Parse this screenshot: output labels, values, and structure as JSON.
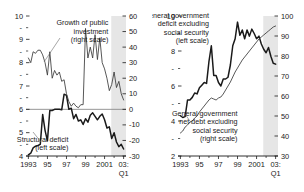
{
  "chart_data": [
    {
      "type": "line",
      "panel": "left",
      "title": "",
      "xlabel": "",
      "ylabel_left": "",
      "ylabel_right": "",
      "xlim": [
        1992.75,
        2003.25
      ],
      "x_tick_labels": [
        "1993",
        "95",
        "97",
        "99",
        "2001",
        "03:"
      ],
      "x_tick_values": [
        1993,
        1995,
        1997,
        1999,
        2001,
        2003
      ],
      "x_tick_sublabel": "Q1",
      "left_axis": {
        "ylim": [
          4,
          10
        ],
        "tick_labels": [
          "4",
          "5",
          "6",
          "7",
          "8",
          "9",
          "10"
        ],
        "tick_values": [
          4,
          5,
          6,
          7,
          8,
          9,
          10
        ],
        "minor_tick_values": [
          4.5,
          5.5,
          6.5,
          7.5,
          8.5,
          9.5
        ]
      },
      "right_axis": {
        "ylim": [
          -30,
          60
        ],
        "tick_labels": [
          "-30",
          "-20",
          "-10",
          "0",
          "10",
          "20",
          "30",
          "40",
          "50",
          "60"
        ],
        "tick_values": [
          -30,
          -20,
          -10,
          0,
          10,
          20,
          30,
          40,
          50,
          60
        ]
      },
      "shaded_band": {
        "x_start": 2001.7,
        "x_end": 2003.25,
        "color": "#e6e6e6"
      },
      "zero_reference": {
        "right_value": 0,
        "left_value": 6,
        "color": "#8a8a8a"
      },
      "annotations": [
        {
          "text_lines": [
            "Growth of public",
            "investment",
            "(right scale)"
          ],
          "x": 2001.4,
          "y": 54
        },
        {
          "text_lines": [
            "Structural deficit",
            "(left scale)"
          ],
          "x": 1997.2,
          "y": -21
        }
      ],
      "series": [
        {
          "name": "Structural deficit (left scale)",
          "axis": "left",
          "style": "thick",
          "x": [
            1993.0,
            1993.25,
            1993.5,
            1993.75,
            1994.0,
            1994.25,
            1994.5,
            1994.75,
            1995.0,
            1995.25,
            1995.5,
            1995.75,
            1996.0,
            1996.25,
            1996.5,
            1996.75,
            1997.0,
            1997.25,
            1997.5,
            1997.75,
            1998.0,
            1998.25,
            1998.5,
            1998.75,
            1999.0,
            1999.25,
            1999.5,
            1999.75,
            2000.0,
            2000.25,
            2000.5,
            2000.75,
            2001.0,
            2001.25,
            2001.5,
            2001.75,
            2002.0,
            2002.25,
            2002.5,
            2002.75,
            2003.0
          ],
          "values": [
            4.05,
            4.12,
            4.35,
            4.42,
            4.45,
            4.5,
            5.78,
            5.1,
            4.65,
            5.95,
            5.95,
            6.0,
            6.0,
            6.0,
            5.98,
            6.65,
            6.6,
            6.0,
            6.05,
            5.6,
            5.78,
            5.5,
            5.55,
            5.35,
            5.6,
            5.45,
            5.75,
            5.85,
            5.7,
            5.55,
            5.7,
            5.8,
            5.55,
            5.2,
            5.25,
            4.75,
            5.0,
            4.6,
            4.4,
            4.5,
            4.3
          ]
        },
        {
          "name": "Growth of public investment (right scale)",
          "axis": "right",
          "style": "thin",
          "x": [
            1993.0,
            1993.25,
            1993.5,
            1993.75,
            1994.0,
            1994.25,
            1994.5,
            1994.75,
            1995.0,
            1995.25,
            1995.5,
            1995.75,
            1996.0,
            1996.25,
            1996.5,
            1996.75,
            1997.0,
            1997.25,
            1997.5,
            1997.75,
            1998.0,
            1998.25,
            1998.5,
            1998.75,
            1999.0,
            1999.25,
            1999.5,
            1999.75,
            2000.0,
            2000.25,
            2000.5,
            2000.75,
            2001.0,
            2001.25,
            2001.5,
            2001.75,
            2002.0,
            2002.25,
            2002.5,
            2002.75,
            2003.0
          ],
          "values": [
            33,
            30,
            37,
            36,
            38,
            38,
            35,
            30,
            22,
            37,
            20,
            25,
            22,
            24,
            18,
            19,
            10,
            5,
            2,
            4,
            2,
            1,
            3,
            3,
            52,
            33,
            40,
            33,
            48,
            32,
            46,
            30,
            26,
            20,
            12,
            16,
            24,
            14,
            18,
            10,
            6
          ]
        }
      ]
    },
    {
      "type": "line",
      "panel": "right",
      "title": "",
      "xlabel": "",
      "xlim": [
        1992.75,
        2003.25
      ],
      "x_tick_labels": [
        "1993",
        "95",
        "97",
        "99",
        "2001",
        "03:"
      ],
      "x_tick_values": [
        1993,
        1995,
        1997,
        1999,
        2001,
        2003
      ],
      "x_tick_sublabel": "Q1",
      "left_axis": {
        "ylim": [
          2,
          10
        ],
        "tick_labels": [
          "2",
          "4",
          "6",
          "8",
          "10"
        ],
        "tick_values": [
          2,
          4,
          6,
          8,
          10
        ],
        "minor_tick_values": [
          3,
          5,
          7,
          9
        ]
      },
      "right_axis": {
        "ylim": [
          30,
          100
        ],
        "tick_labels": [
          "30",
          "40",
          "50",
          "60",
          "70",
          "80",
          "90",
          "100"
        ],
        "tick_values": [
          30,
          40,
          50,
          60,
          70,
          80,
          90,
          100
        ]
      },
      "shaded_band": {
        "x_start": 2001.7,
        "x_end": 2003.25,
        "color": "#e6e6e6"
      },
      "annotations": [
        {
          "text_lines": [
            "General government",
            "deficit excluding",
            "social security",
            "(left scale)"
          ],
          "x": 1996.0,
          "y": 9.9
        },
        {
          "text_lines": [
            "General government",
            "net debt excluding",
            "social security",
            "(right scale)"
          ],
          "x": 1999.0,
          "y": 4.3
        }
      ],
      "series": [
        {
          "name": "General government deficit excluding social security (left scale)",
          "axis": "left",
          "style": "thick",
          "x": [
            1993.0,
            1993.25,
            1993.5,
            1993.75,
            1994.0,
            1994.25,
            1994.5,
            1994.75,
            1995.0,
            1995.25,
            1995.5,
            1995.75,
            1996.0,
            1996.25,
            1996.5,
            1996.75,
            1997.0,
            1997.25,
            1997.5,
            1997.75,
            1998.0,
            1998.25,
            1998.5,
            1998.75,
            1999.0,
            1999.25,
            1999.5,
            1999.75,
            2000.0,
            2000.25,
            2000.5,
            2000.75,
            2001.0,
            2001.25,
            2001.5,
            2001.75,
            2002.0,
            2002.25,
            2002.5,
            2002.75,
            2003.0
          ],
          "values": [
            4.3,
            4.2,
            4.25,
            5.2,
            5.2,
            5.35,
            5.6,
            5.55,
            5.9,
            6.05,
            6.2,
            6.15,
            7.4,
            8.3,
            6.6,
            6.6,
            6.2,
            6.0,
            6.4,
            6.4,
            6.5,
            7.2,
            8.3,
            8.7,
            9.65,
            8.9,
            9.2,
            8.7,
            9.2,
            8.85,
            9.25,
            9.0,
            8.7,
            8.85,
            8.4,
            8.1,
            7.9,
            8.2,
            7.7,
            7.3,
            7.25
          ]
        },
        {
          "name": "General government net debt excluding social security (right scale)",
          "axis": "right",
          "style": "thin",
          "x": [
            1993.0,
            1993.25,
            1993.5,
            1993.75,
            1994.0,
            1994.25,
            1994.5,
            1994.75,
            1995.0,
            1995.25,
            1995.5,
            1995.75,
            1996.0,
            1996.25,
            1996.5,
            1996.75,
            1997.0,
            1997.25,
            1997.5,
            1997.75,
            1998.0,
            1998.25,
            1998.5,
            1998.75,
            1999.0,
            1999.25,
            1999.5,
            1999.75,
            2000.0,
            2000.25,
            2000.5,
            2000.75,
            2001.0,
            2001.25,
            2001.5,
            2001.75,
            2002.0,
            2002.25,
            2002.5,
            2002.75,
            2003.0
          ],
          "values": [
            41.5,
            42.5,
            44.5,
            45.5,
            47,
            47.5,
            49,
            50,
            52,
            53.5,
            55,
            56.5,
            58,
            59,
            58.5,
            58,
            59,
            59.5,
            61,
            63,
            65,
            67,
            69.5,
            72,
            74,
            76,
            78,
            79.5,
            81,
            82.5,
            84,
            85.5,
            87,
            88.5,
            89.5,
            90.5,
            91.5,
            92.5,
            93.5,
            94.5,
            95
          ]
        }
      ]
    }
  ]
}
